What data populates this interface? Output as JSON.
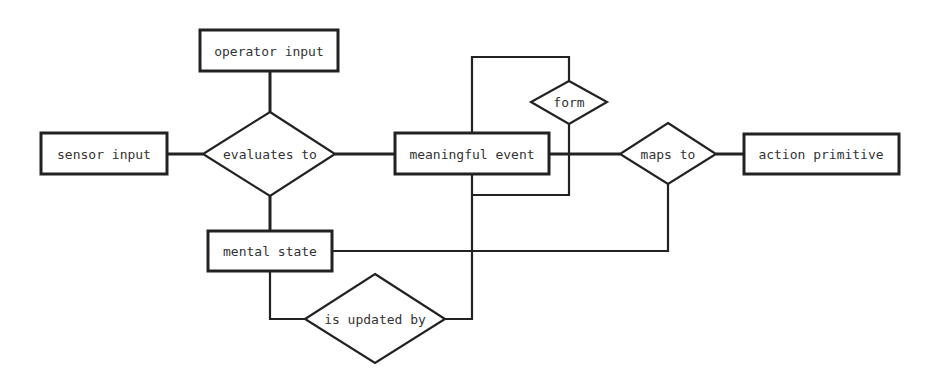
{
  "diagram": {
    "type": "entity-relationship",
    "entities": [
      {
        "id": "operator_input",
        "label": "operator input"
      },
      {
        "id": "sensor_input",
        "label": "sensor input"
      },
      {
        "id": "meaningful_event",
        "label": "meaningful event"
      },
      {
        "id": "action_primitive",
        "label": "action primitive"
      },
      {
        "id": "mental_state",
        "label": "mental state"
      }
    ],
    "relationships": [
      {
        "id": "evaluates_to",
        "label": "evaluates to"
      },
      {
        "id": "maps_to",
        "label": "maps to"
      },
      {
        "id": "form",
        "label": "form"
      },
      {
        "id": "is_updated_by",
        "label": "is updated by"
      }
    ],
    "connections": [
      [
        "operator input",
        "evaluates to"
      ],
      [
        "sensor input",
        "evaluates to"
      ],
      [
        "evaluates to",
        "meaningful event"
      ],
      [
        "evaluates to",
        "mental state"
      ],
      [
        "meaningful event",
        "maps to"
      ],
      [
        "maps to",
        "action primitive"
      ],
      [
        "maps to",
        "mental state"
      ],
      [
        "meaningful event",
        "form"
      ],
      [
        "form",
        "meaningful event"
      ],
      [
        "mental state",
        "is updated by"
      ],
      [
        "is updated by",
        "meaningful event"
      ]
    ],
    "colors": {
      "stroke": "#222222",
      "text": "#333333",
      "background": "#ffffff"
    }
  }
}
